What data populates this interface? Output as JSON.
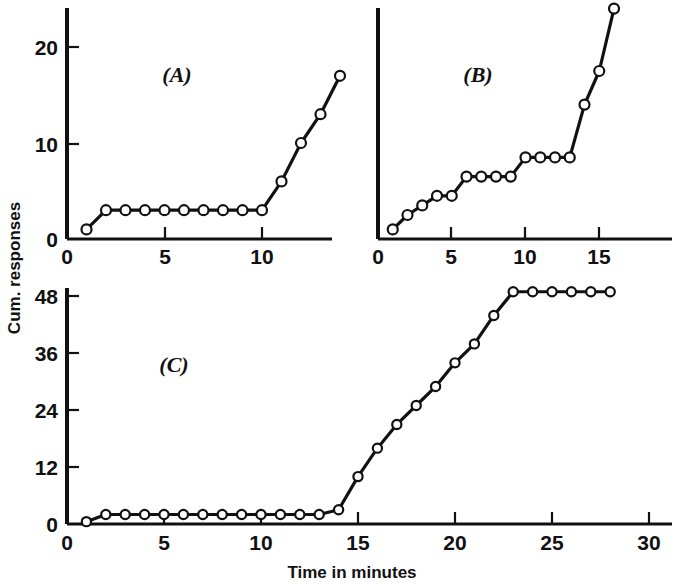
{
  "figure": {
    "axis_title_x": "Time in minutes",
    "axis_title_y": "Cum. responses",
    "panel_a_label": "(A)",
    "panel_b_label": "(B)",
    "panel_c_label": "(C)",
    "line_color": "#111111",
    "marker_fill": "#ffffff",
    "background": "#ffffff"
  },
  "panel_a": {
    "ticks_x": [
      "0",
      "5",
      "10"
    ],
    "ticks_y": [
      "0",
      "10",
      "20"
    ]
  },
  "panel_b": {
    "ticks_x": [
      "0",
      "5",
      "10",
      "15"
    ]
  },
  "panel_c": {
    "ticks_x": [
      "0",
      "5",
      "10",
      "15",
      "20",
      "25",
      "30"
    ],
    "ticks_y": [
      "0",
      "12",
      "24",
      "36",
      "48"
    ]
  },
  "chart_data": [
    {
      "type": "line",
      "title": "(A)",
      "xlabel": "Time in minutes",
      "ylabel": "Cum. responses",
      "xlim": [
        0,
        14
      ],
      "ylim": [
        0,
        23
      ],
      "xticks": [
        0,
        5,
        10
      ],
      "yticks": [
        0,
        10,
        20
      ],
      "grid": false,
      "legend": "none",
      "markers": "open circle",
      "x": [
        1,
        2,
        3,
        4,
        5,
        6,
        7,
        8,
        9,
        10,
        11,
        12,
        13,
        14
      ],
      "values": [
        1,
        3,
        3,
        3,
        3,
        3,
        3,
        3,
        3,
        3,
        6,
        10,
        13,
        17
      ]
    },
    {
      "type": "line",
      "title": "(B)",
      "xlabel": "Time in minutes",
      "ylabel": "Cum. responses",
      "xlim": [
        0,
        16
      ],
      "ylim": [
        0,
        24
      ],
      "xticks": [
        0,
        5,
        10,
        15
      ],
      "yticks": [
        0,
        10,
        20
      ],
      "grid": false,
      "legend": "none",
      "markers": "open circle",
      "x": [
        1,
        2,
        3,
        4,
        5,
        6,
        7,
        8,
        9,
        10,
        11,
        12,
        13,
        14,
        15,
        16
      ],
      "values": [
        1,
        2.5,
        3.5,
        4.5,
        4.5,
        6.5,
        6.5,
        6.5,
        6.5,
        8.5,
        8.5,
        8.5,
        8.5,
        14,
        17.5,
        24
      ]
    },
    {
      "type": "line",
      "title": "(C)",
      "xlabel": "Time in minutes",
      "ylabel": "Cum. responses",
      "xlim": [
        0,
        31
      ],
      "ylim": [
        0,
        52
      ],
      "xticks": [
        0,
        5,
        10,
        15,
        20,
        25,
        30
      ],
      "yticks": [
        0,
        12,
        24,
        36,
        48
      ],
      "grid": false,
      "legend": "none",
      "markers": "open circle",
      "x": [
        1,
        2,
        3,
        4,
        5,
        6,
        7,
        8,
        9,
        10,
        11,
        12,
        13,
        14,
        15,
        16,
        17,
        18,
        19,
        20,
        21,
        22,
        23,
        24,
        25,
        26,
        27,
        28
      ],
      "values": [
        0.5,
        2,
        2,
        2,
        2,
        2,
        2,
        2,
        2,
        2,
        2,
        2,
        2,
        3,
        10,
        16,
        21,
        25,
        29,
        34,
        38,
        44,
        49,
        49,
        49,
        49,
        49,
        49
      ]
    }
  ]
}
